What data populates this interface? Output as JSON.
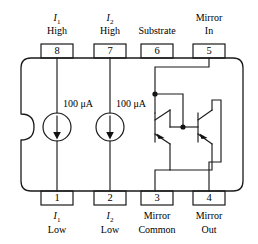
{
  "diagram": {
    "package": {
      "type": "8-pin-dip",
      "notch_side": "left",
      "outline_color": "#1a1a1a",
      "background_color": "#ffffff"
    },
    "top_pins": [
      {
        "number": "8",
        "label_line1": "I",
        "label_sub": "1",
        "label_line2": "High",
        "x": 57
      },
      {
        "number": "7",
        "label_line1": "I",
        "label_sub": "2",
        "label_line2": "High",
        "x": 110
      },
      {
        "number": "6",
        "label_line1": "Substrate",
        "label_sub": "",
        "label_line2": "",
        "x": 157
      },
      {
        "number": "5",
        "label_line1": "Mirror",
        "label_sub": "",
        "label_line2": "In",
        "x": 209
      }
    ],
    "bottom_pins": [
      {
        "number": "1",
        "label_line1": "I",
        "label_sub": "1",
        "label_line2": "Low",
        "x": 57
      },
      {
        "number": "2",
        "label_line1": "I",
        "label_sub": "2",
        "label_line2": "Low",
        "x": 110
      },
      {
        "number": "3",
        "label_line1": "Mirror",
        "label_sub": "",
        "label_line2": "Common",
        "x": 157
      },
      {
        "number": "4",
        "label_line1": "Mirror",
        "label_sub": "",
        "label_line2": "Out",
        "x": 209
      }
    ],
    "current_sources": [
      {
        "name": "source-1",
        "value": "100",
        "unit": "μA",
        "label": "100 μA",
        "cx": 57,
        "cy": 127,
        "r": 14,
        "direction": "down"
      },
      {
        "name": "source-2",
        "value": "100",
        "unit": "μA",
        "label": "100 μA",
        "cx": 110,
        "cy": 127,
        "r": 14,
        "direction": "down"
      }
    ],
    "transistors": [
      {
        "name": "mirror-input-transistor",
        "type": "npn",
        "orientation": "left"
      },
      {
        "name": "mirror-output-transistor",
        "type": "npn",
        "orientation": "right"
      }
    ],
    "nodes": [
      {
        "name": "collector-base-node",
        "x": 155,
        "y": 94
      },
      {
        "name": "common-base-node",
        "x": 183,
        "y": 127
      }
    ]
  }
}
